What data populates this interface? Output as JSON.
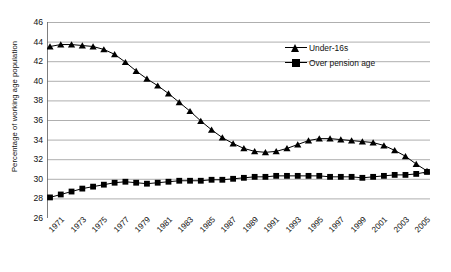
{
  "chart_data": {
    "type": "line",
    "title": "",
    "xlabel": "",
    "ylabel": "Percentage of working age population",
    "ylim": [
      26,
      46
    ],
    "ytick_step": 2,
    "yticks": [
      26,
      28,
      30,
      32,
      34,
      36,
      38,
      40,
      42,
      44,
      46
    ],
    "grid": true,
    "legend_position": "top-right",
    "x": [
      1971,
      1972,
      1973,
      1974,
      1975,
      1976,
      1977,
      1978,
      1979,
      1980,
      1981,
      1982,
      1983,
      1984,
      1985,
      1986,
      1987,
      1988,
      1989,
      1990,
      1991,
      1992,
      1993,
      1994,
      1995,
      1996,
      1997,
      1998,
      1999,
      2000,
      2001,
      2002,
      2003,
      2004,
      2005,
      2006
    ],
    "xtick_labels": [
      "1971",
      "1973",
      "1975",
      "1977",
      "1979",
      "1981",
      "1983",
      "1985",
      "1987",
      "1989",
      "1991",
      "1993",
      "1995",
      "1997",
      "1999",
      "2001",
      "2003",
      "2005"
    ],
    "series": [
      {
        "name": "Under-16s",
        "marker": "triangle",
        "values": [
          43.5,
          43.7,
          43.7,
          43.6,
          43.5,
          43.2,
          42.7,
          41.9,
          41.0,
          40.2,
          39.5,
          38.7,
          37.8,
          36.9,
          35.9,
          35.0,
          34.2,
          33.6,
          33.1,
          32.8,
          32.7,
          32.8,
          33.1,
          33.5,
          33.9,
          34.1,
          34.1,
          34.0,
          33.9,
          33.8,
          33.7,
          33.4,
          32.9,
          32.3,
          31.5,
          30.8
        ]
      },
      {
        "name": "Over pension age",
        "marker": "square",
        "values": [
          28.1,
          28.4,
          28.7,
          29.0,
          29.2,
          29.4,
          29.6,
          29.7,
          29.6,
          29.5,
          29.6,
          29.7,
          29.8,
          29.8,
          29.8,
          29.9,
          29.9,
          30.0,
          30.1,
          30.2,
          30.2,
          30.3,
          30.3,
          30.3,
          30.3,
          30.3,
          30.2,
          30.2,
          30.2,
          30.1,
          30.2,
          30.3,
          30.4,
          30.4,
          30.5,
          30.7
        ]
      }
    ]
  },
  "legend": {
    "items": [
      {
        "label": "Under-16s"
      },
      {
        "label": "Over pension age"
      }
    ]
  },
  "colors": {
    "line": "#000000",
    "grid": "#9a9a9a",
    "axis": "#6f6f6f",
    "text": "#111111"
  }
}
